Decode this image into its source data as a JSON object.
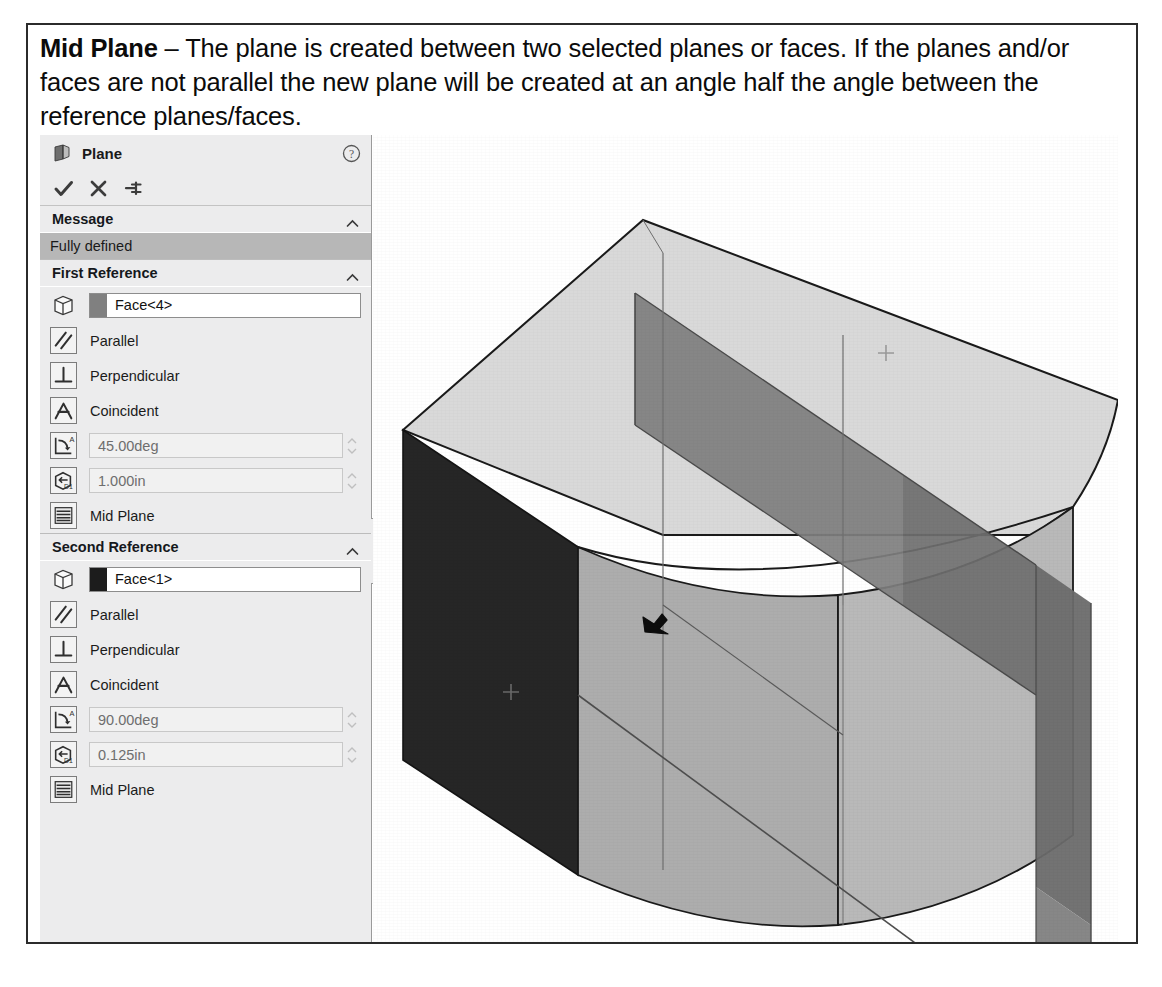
{
  "caption": {
    "term": "Mid Plane",
    "dash": " – ",
    "body": "The plane is created between two selected planes or faces. If the planes and/or faces are not parallel the new plane will be created at an angle half the angle between the reference planes/faces."
  },
  "panel": {
    "title": "Plane",
    "title_icon": "plane-icon",
    "help_icon": "help-question-icon",
    "toolbar": {
      "accept_icon": "checkmark-icon",
      "cancel_icon": "close-x-icon",
      "pin_icon": "pushpin-icon"
    },
    "message_section": {
      "header": "Message",
      "collapse_icon": "chevron-up-icon",
      "status": "Fully defined",
      "status_bg": "#b7b7b7"
    },
    "first_reference": {
      "header": "First Reference",
      "collapse_icon": "chevron-up-icon",
      "selection": {
        "icon": "face-cube-icon",
        "value": "Face<4>",
        "swatch_color": "#808080"
      },
      "constraints": [
        {
          "icon": "parallel-icon",
          "label": "Parallel"
        },
        {
          "icon": "perpendicular-icon",
          "label": "Perpendicular"
        },
        {
          "icon": "coincident-icon",
          "label": "Coincident"
        }
      ],
      "angle": {
        "icon": "angle-icon",
        "value": "45.00deg"
      },
      "offset": {
        "icon": "offset-distance-icon",
        "value": "1.000in"
      },
      "mid_plane": {
        "icon": "mid-plane-icon",
        "label": "Mid Plane"
      }
    },
    "second_reference": {
      "header": "Second Reference",
      "collapse_icon": "chevron-up-icon",
      "selection": {
        "icon": "face-cube-icon",
        "value": "Face<1>",
        "swatch_color": "#1c1c1c"
      },
      "constraints": [
        {
          "icon": "parallel-icon",
          "label": "Parallel"
        },
        {
          "icon": "perpendicular-icon",
          "label": "Perpendicular"
        },
        {
          "icon": "coincident-icon",
          "label": "Coincident"
        }
      ],
      "angle": {
        "icon": "angle-icon",
        "value": "90.00deg"
      },
      "offset": {
        "icon": "offset-distance-icon",
        "value": "0.125in"
      },
      "mid_plane": {
        "icon": "mid-plane-icon",
        "label": "Mid Plane"
      }
    },
    "edge_handle_icon": "panel-resize-handle"
  },
  "viewport": {
    "model_name": "mid-plane-3d-model",
    "colors": {
      "top_face": "#d9d9d9",
      "dark_face": "#262626",
      "front_face": "#adadad",
      "right_face": "#b9b9b9",
      "plane_sheet": "#7f7f7f",
      "outline": "#1a1a1a"
    },
    "annotations": {
      "origin_marker_icon": "plane-center-cross-icon",
      "cursor_icon": "mouse-cursor-icon"
    }
  }
}
